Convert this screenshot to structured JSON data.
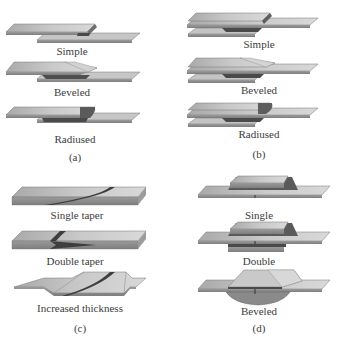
{
  "figure": {
    "panels": [
      {
        "id": "a",
        "label": "(a)",
        "items": [
          {
            "label": "Simple"
          },
          {
            "label": "Beveled"
          },
          {
            "label": "Radiused"
          }
        ]
      },
      {
        "id": "b",
        "label": "(b)",
        "items": [
          {
            "label": "Simple"
          },
          {
            "label": "Beveled"
          },
          {
            "label": "Radiused"
          }
        ]
      },
      {
        "id": "c",
        "label": "(c)",
        "items": [
          {
            "label": "Single taper"
          },
          {
            "label": "Double taper"
          },
          {
            "label": "Increased thickness"
          }
        ]
      },
      {
        "id": "d",
        "label": "(d)",
        "items": [
          {
            "label": "Single"
          },
          {
            "label": "Double"
          },
          {
            "label": "Beveled"
          }
        ]
      }
    ],
    "colors": {
      "plate_top": "#b8b8b8",
      "plate_top_light": "#d0d0d0",
      "plate_side": "#8e8e8e",
      "plate_edge": "#6a6a6a",
      "adhesive": "#4a4a4a",
      "text": "#3c3c3c"
    }
  }
}
